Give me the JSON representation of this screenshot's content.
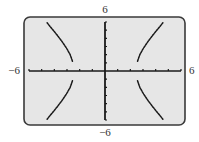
{
  "chart_data": {
    "type": "line",
    "title": "",
    "xlabel": "",
    "ylabel": "",
    "xlim": [
      -6,
      6
    ],
    "ylim": [
      -6,
      6
    ],
    "x_tick_step": 1,
    "y_tick_step": 1,
    "grid": false,
    "legend": "none",
    "axis_labels": {
      "x_min": "−6",
      "x_max": "6",
      "y_min": "−6",
      "y_max": "6"
    },
    "curve_description": "hyperbola approximately x^2/6 - y^2/14 = 1, four branches drawn dotted",
    "series": [
      {
        "name": "upper-right-branch",
        "points": [
          [
            2.57,
            1.2
          ],
          [
            2.75,
            2.0
          ],
          [
            3.04,
            2.8
          ],
          [
            3.39,
            3.6
          ],
          [
            3.78,
            4.4
          ],
          [
            4.2,
            5.2
          ],
          [
            4.57,
            5.9
          ]
        ]
      },
      {
        "name": "lower-right-branch",
        "points": [
          [
            2.57,
            -1.2
          ],
          [
            2.75,
            -2.0
          ],
          [
            3.04,
            -2.8
          ],
          [
            3.39,
            -3.6
          ],
          [
            3.78,
            -4.4
          ],
          [
            4.2,
            -5.2
          ],
          [
            4.57,
            -5.9
          ]
        ]
      },
      {
        "name": "upper-left-branch",
        "points": [
          [
            -2.57,
            1.2
          ],
          [
            -2.75,
            2.0
          ],
          [
            -3.04,
            2.8
          ],
          [
            -3.39,
            3.6
          ],
          [
            -3.78,
            4.4
          ],
          [
            -4.2,
            5.2
          ],
          [
            -4.57,
            5.9
          ]
        ]
      },
      {
        "name": "lower-left-branch",
        "points": [
          [
            -2.57,
            -1.2
          ],
          [
            -2.75,
            -2.0
          ],
          [
            -3.04,
            -2.8
          ],
          [
            -3.39,
            -3.6
          ],
          [
            -3.78,
            -4.4
          ],
          [
            -4.2,
            -5.2
          ],
          [
            -4.57,
            -5.9
          ]
        ]
      }
    ],
    "colors": {
      "screen_background": "#e6e6e6",
      "frame": "#3a3a3a",
      "axes": "#1a1a1a",
      "curve": "#1a1a1a"
    }
  }
}
